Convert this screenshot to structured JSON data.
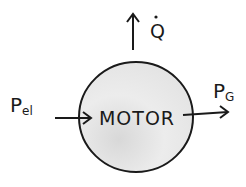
{
  "diagram": {
    "center_label": "MOTOR",
    "input": {
      "symbol": "P",
      "subscript": "el"
    },
    "output": {
      "symbol": "P",
      "subscript": "G"
    },
    "heat": {
      "symbol": "Q",
      "dot": "˙"
    },
    "colors": {
      "stroke": "#1a1a1a",
      "fill": "#e6e6e6",
      "background": "#ffffff"
    }
  }
}
